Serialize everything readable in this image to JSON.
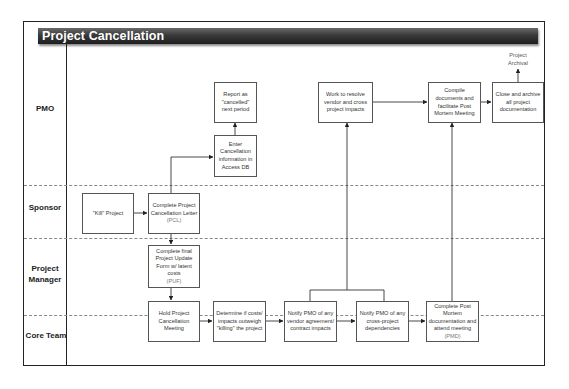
{
  "diagram": {
    "title": "Project Cancellation",
    "type": "swimlane-flowchart",
    "lanes": [
      {
        "id": "pmo",
        "label": "PMO"
      },
      {
        "id": "sponsor",
        "label": "Sponsor"
      },
      {
        "id": "pm",
        "label": "Project Manager"
      },
      {
        "id": "core",
        "label": "Core Team"
      }
    ],
    "nodes": {
      "kill": {
        "lane": "sponsor",
        "text": "\"Kill\" Project"
      },
      "pcl": {
        "lane": "sponsor",
        "text": "Complete Project Cancellation Letter",
        "sub": "(PCL)"
      },
      "enter_db": {
        "lane": "pmo",
        "text": "Enter Cancellation information in Access DB"
      },
      "report": {
        "lane": "pmo",
        "text": "Report as \"cancelled\" next period"
      },
      "puf": {
        "lane": "pm",
        "text": "Complete final Project Update Form w/ latent costs",
        "sub": "(PUF)"
      },
      "hold": {
        "lane": "core",
        "text": "Hold Project Cancellation Meeting"
      },
      "determine": {
        "lane": "core",
        "text": "Determine if costs/ impacts outweigh \"killing\" the project"
      },
      "notify_vendor": {
        "lane": "core",
        "text": "Notify PMO of any vendor agreement/ contract impacts"
      },
      "notify_cross": {
        "lane": "core",
        "text": "Notify PMO of any cross-project dependencies"
      },
      "post_mortem": {
        "lane": "core",
        "text": "Complete Post Mortem documentation and attend meeting",
        "sub": "(PMD)"
      },
      "resolve": {
        "lane": "pmo",
        "text": "Work to resolve vendor and cross project impacts"
      },
      "compile": {
        "lane": "pmo",
        "text": "Compile documents and facilitate Post Mortem Meeting"
      },
      "close": {
        "lane": "pmo",
        "text": "Close and archive all project documentation"
      },
      "archival": {
        "lane": "pmo",
        "text": "Project Archival"
      }
    },
    "edges": [
      [
        "kill",
        "pcl"
      ],
      [
        "pcl",
        "enter_db"
      ],
      [
        "enter_db",
        "report"
      ],
      [
        "pcl",
        "puf"
      ],
      [
        "puf",
        "hold"
      ],
      [
        "hold",
        "determine"
      ],
      [
        "determine",
        "notify_vendor"
      ],
      [
        "notify_vendor",
        "notify_cross"
      ],
      [
        "notify_cross",
        "post_mortem"
      ],
      [
        "notify_vendor",
        "resolve"
      ],
      [
        "notify_cross",
        "resolve"
      ],
      [
        "resolve",
        "compile"
      ],
      [
        "post_mortem",
        "compile"
      ],
      [
        "compile",
        "close"
      ],
      [
        "close",
        "archival"
      ]
    ]
  }
}
